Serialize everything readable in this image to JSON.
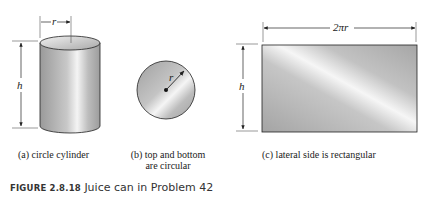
{
  "figure": {
    "label": "FIGURE 2.8.18",
    "title": "Juice can in Problem 42"
  },
  "panels": [
    {
      "id": "a",
      "caption": "(a) circle cylinder",
      "labels": {
        "radius": "r",
        "height": "h"
      }
    },
    {
      "id": "b",
      "caption_line1": "(b) top and bottom",
      "caption_line2": "are circular",
      "labels": {
        "radius": "r"
      }
    },
    {
      "id": "c",
      "caption": "(c) lateral side is rectangular",
      "labels": {
        "width": "2πr",
        "height": "h"
      }
    }
  ],
  "colors": {
    "shape_fill_dark": "#a8a8a8",
    "shape_fill_light": "#f2f2f2",
    "outline": "#222222"
  }
}
